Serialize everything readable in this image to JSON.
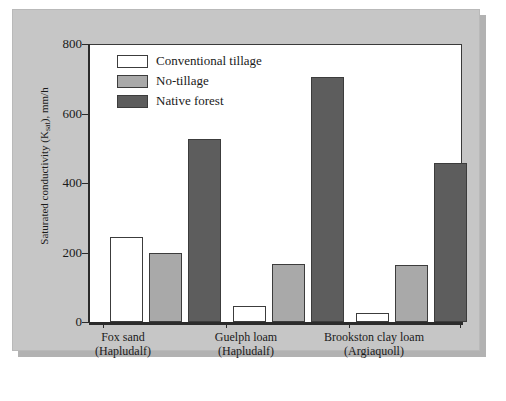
{
  "chart_data": {
    "type": "bar",
    "title": "",
    "subtitle": "",
    "xlabel": "",
    "ylabel": "Saturated conductivity (Ksat), mm/h",
    "ylabel_main": "Saturated conductivity (K",
    "ylabel_sub": "sat",
    "ylabel_tail": "), mm/h",
    "categories": [
      "Fox sand (Hapludalf)",
      "Guelph loam (Hapludalf)",
      "Brookston clay loam (Argiaquoll)"
    ],
    "category_lines": [
      [
        "Fox sand",
        "(Hapludalf)"
      ],
      [
        "Guelph loam",
        "(Hapludalf)"
      ],
      [
        "Brookston clay loam",
        "(Argiaquoll)"
      ]
    ],
    "series": [
      {
        "name": "Conventional tillage",
        "color": "#ffffff",
        "values": [
          245,
          45,
          25
        ]
      },
      {
        "name": "No-tillage",
        "color": "#a9a9a9",
        "values": [
          200,
          168,
          165
        ]
      },
      {
        "name": "Native forest",
        "color": "#5d5d5d",
        "values": [
          527,
          705,
          458
        ]
      }
    ],
    "ylim": [
      0,
      800
    ],
    "yticks": [
      0,
      200,
      400,
      600,
      800
    ],
    "ytick_labels": [
      "0",
      "200",
      "400",
      "600",
      "800"
    ],
    "grid": false,
    "legend_position": "upper-left-inside",
    "background_color": "#c6c6c6",
    "plot_background_color": "#ffffff",
    "axis_color": "#2b2b2b"
  }
}
